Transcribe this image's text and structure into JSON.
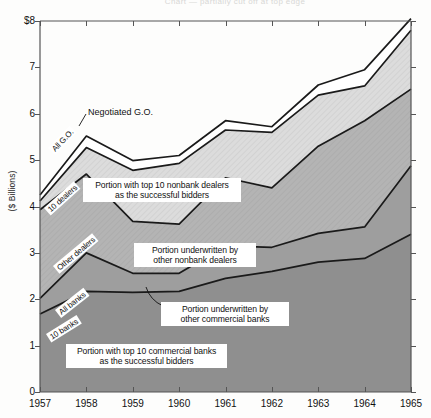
{
  "figure": {
    "ghost_title": "Chart — partially cut off at top edge",
    "ylabel": "($ Billions)"
  },
  "axis": {
    "y_ticks": [
      "$8",
      "7",
      "6",
      "5",
      "4",
      "3",
      "2",
      "1",
      "0"
    ],
    "x_ticks": [
      "1957",
      "1958",
      "1959",
      "1960",
      "1961",
      "1962",
      "1963",
      "1964",
      "1965"
    ]
  },
  "annotations": {
    "negotiated_go": "Negotiated G.O.",
    "top10_nonbank": "Portion with top 10 nonbank dealers\nas the successful bidders",
    "other_nonbank": "Portion underwritten by\nother nonbank dealers",
    "other_commercial": "Portion underwritten by\nother commercial banks",
    "top10_commercial": "Portion with top 10 commercial banks\nas the successful bidders",
    "diag_all_go": "All G.O.",
    "diag_10_dealers": "10 dealers",
    "diag_other_dealers": "Other dealers",
    "diag_all_banks": "All banks",
    "diag_10_banks": "10 banks"
  },
  "colors": {
    "band_top10_commercial": "#8f8f8f",
    "band_other_commercial": "#9e9e9e",
    "band_other_nonbank": "#b4b4b4",
    "band_top10_nonbank": "#dcdcdc",
    "band_negotiated": "#ffffff",
    "line": "#1a1a1a",
    "axis": "#555555"
  },
  "chart_data": {
    "type": "area",
    "title": "",
    "subtitle": "",
    "xlabel": "",
    "ylabel": "($ Billions)",
    "x": [
      1957,
      1958,
      1959,
      1960,
      1961,
      1962,
      1963,
      1964,
      1965
    ],
    "xlim": [
      1957,
      1965
    ],
    "ylim": [
      0,
      8
    ],
    "y_ticks": [
      0,
      1,
      2,
      3,
      4,
      5,
      6,
      7,
      8
    ],
    "grid": false,
    "legend": "inline-annotations",
    "stacked": true,
    "note": "Cumulative boundary values read off the y-axis; series values are the differences between successive boundaries.",
    "cumulative_boundaries": [
      {
        "name": "10 banks (top 10 commercial banks)",
        "values": [
          1.68,
          2.17,
          2.15,
          2.17,
          2.45,
          2.6,
          2.8,
          2.88,
          3.4
        ]
      },
      {
        "name": "All banks",
        "values": [
          2.02,
          3.0,
          2.56,
          2.56,
          3.15,
          3.12,
          3.42,
          3.56,
          4.88
        ]
      },
      {
        "name": "10 dealers",
        "values": [
          3.93,
          4.7,
          3.68,
          3.62,
          4.62,
          4.4,
          5.3,
          5.85,
          6.53
        ]
      },
      {
        "name": "All G.O.",
        "values": [
          4.12,
          5.27,
          4.78,
          4.93,
          5.65,
          5.6,
          6.4,
          6.6,
          7.8
        ]
      },
      {
        "name": "Negotiated G.O.",
        "values": [
          4.25,
          5.52,
          4.99,
          5.1,
          5.85,
          5.72,
          6.62,
          6.95,
          8.05
        ]
      }
    ],
    "series": [
      {
        "name": "Portion with top 10 commercial banks as the successful bidders",
        "values": [
          1.68,
          2.17,
          2.15,
          2.17,
          2.45,
          2.6,
          2.8,
          2.88,
          3.4
        ]
      },
      {
        "name": "Portion underwritten by other commercial banks",
        "values": [
          0.34,
          0.83,
          0.41,
          0.39,
          0.7,
          0.52,
          0.62,
          0.68,
          1.48
        ]
      },
      {
        "name": "Portion underwritten by other nonbank dealers",
        "values": [
          1.91,
          1.7,
          1.12,
          1.06,
          1.47,
          1.28,
          1.88,
          2.29,
          1.65
        ]
      },
      {
        "name": "Portion with top 10 nonbank dealers as the successful bidders",
        "values": [
          0.19,
          0.57,
          1.1,
          1.31,
          1.03,
          1.2,
          1.1,
          0.75,
          1.27
        ]
      },
      {
        "name": "Negotiated G.O.",
        "values": [
          0.13,
          0.25,
          0.21,
          0.17,
          0.2,
          0.12,
          0.22,
          0.35,
          0.25
        ]
      }
    ]
  }
}
